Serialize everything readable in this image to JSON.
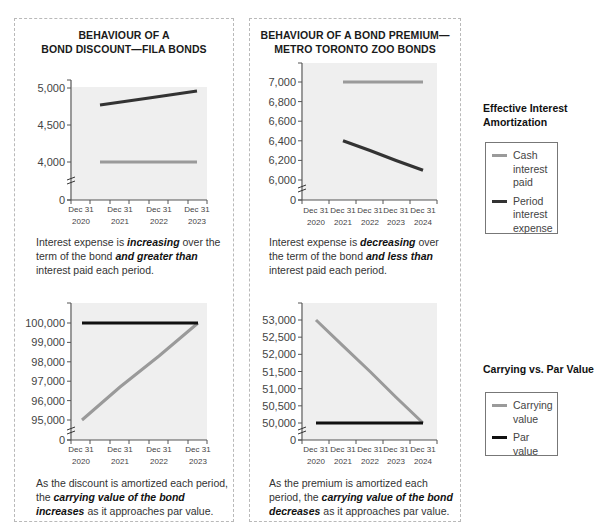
{
  "colors": {
    "cash_interest": "#9a9a9a",
    "interest_expense": "#333333",
    "carrying_value": "#9a9a9a",
    "par_value": "#111111",
    "plot_bg": "#efefef",
    "axis": "#555555"
  },
  "panels": [
    {
      "title_line1": "BEHAVIOUR OF A",
      "title_line2": "BOND DISCOUNT—FILA BONDS",
      "caption_top": {
        "p1": "Interest expense is ",
        "b1": "increasing",
        "p2": " over the term of the bond ",
        "b2": "and greater than",
        "p3": " interest paid each period."
      },
      "caption_bottom": {
        "p1": "As the discount is amortized each period, the ",
        "b1": "carrying value of the bond increases",
        "p2": " as it approaches par value."
      }
    },
    {
      "title_line1": "BEHAVIOUR OF A BOND PREMIUM—",
      "title_line2": "METRO TORONTO ZOO BONDS",
      "caption_top": {
        "p1": "Interest expense is ",
        "b1": "decreasing",
        "p2": " over the term of the bond ",
        "b2": "and less than",
        "p3": " interest paid each period."
      },
      "caption_bottom": {
        "p1": "As the premium is amortized each period, the ",
        "b1": "carrying value of the bond decreases",
        "p2": " as it approaches par value."
      }
    }
  ],
  "legends": [
    {
      "title_line1": "Effective Interest",
      "title_line2": "Amortization",
      "items": [
        {
          "label_lines": [
            "Cash",
            "interest",
            "paid"
          ],
          "color": "#9a9a9a"
        },
        {
          "label_lines": [
            "Period",
            "interest",
            "expense"
          ],
          "color": "#333333"
        }
      ]
    },
    {
      "title_line1": "Carrying vs. Par Value",
      "title_line2": "",
      "items": [
        {
          "label_lines": [
            "Carrying",
            "value"
          ],
          "color": "#9a9a9a"
        },
        {
          "label_lines": [
            "Par",
            "value"
          ],
          "color": "#111111"
        }
      ]
    }
  ],
  "chart_data": [
    {
      "type": "line",
      "title": "BEHAVIOUR OF A BOND DISCOUNT—FILA BONDS",
      "categories": [
        "Dec 31 2020",
        "Dec 31 2021",
        "Dec 31 2022",
        "Dec 31 2023"
      ],
      "series": [
        {
          "name": "Cash interest paid",
          "values": [
            null,
            4000,
            4000,
            4000
          ]
        },
        {
          "name": "Period interest expense",
          "values": [
            null,
            4770,
            4865,
            4960
          ]
        }
      ],
      "yticks": [
        "0",
        "4,000",
        "4,500",
        "5,000"
      ],
      "ylim": [
        0,
        5000
      ],
      "axis_break": true,
      "xlabel": "",
      "ylabel": "",
      "grid": false,
      "legend_position": "right"
    },
    {
      "type": "line",
      "title": "BEHAVIOUR OF A BOND PREMIUM—METRO TORONTO ZOO BONDS",
      "categories": [
        "Dec 31 2020",
        "Dec 31 2021",
        "Dec 31 2022",
        "Dec 31 2023",
        "Dec 31 2024"
      ],
      "series": [
        {
          "name": "Cash interest paid",
          "values": [
            null,
            7000,
            7000,
            7000,
            7000
          ]
        },
        {
          "name": "Period interest expense",
          "values": [
            null,
            6400,
            6300,
            6200,
            6100
          ]
        }
      ],
      "yticks": [
        "0",
        "6,000",
        "6,200",
        "6,400",
        "6,600",
        "6,800",
        "7,000"
      ],
      "ylim": [
        0,
        7150
      ],
      "axis_break": true,
      "xlabel": "",
      "ylabel": "",
      "grid": false,
      "legend_position": "right"
    },
    {
      "type": "line",
      "title": "Carrying vs. Par Value (Discount)",
      "categories": [
        "Dec 31 2020",
        "Dec 31 2021",
        "Dec 31 2022",
        "Dec 31 2023"
      ],
      "series": [
        {
          "name": "Carrying value",
          "values": [
            95000,
            96700,
            98300,
            100000
          ]
        },
        {
          "name": "Par value",
          "values": [
            100000,
            100000,
            100000,
            100000
          ]
        }
      ],
      "yticks": [
        "0",
        "95,000",
        "96,000",
        "97,000",
        "98,000",
        "99,000",
        "100,000"
      ],
      "ylim": [
        0,
        101000
      ],
      "axis_break": true,
      "xlabel": "",
      "ylabel": "",
      "grid": false,
      "legend_position": "right"
    },
    {
      "type": "line",
      "title": "Carrying vs. Par Value (Premium)",
      "categories": [
        "Dec 31 2020",
        "Dec 31 2021",
        "Dec 31 2022",
        "Dec 31 2023",
        "Dec 31 2024"
      ],
      "series": [
        {
          "name": "Carrying value",
          "values": [
            53000,
            52250,
            51500,
            50750,
            50000
          ]
        },
        {
          "name": "Par value",
          "values": [
            50000,
            50000,
            50000,
            50000,
            50000
          ]
        }
      ],
      "yticks": [
        "0",
        "50,000",
        "50,500",
        "51,000",
        "51,500",
        "52,000",
        "52,500",
        "53,000"
      ],
      "ylim": [
        0,
        53500
      ],
      "axis_break": true,
      "xlabel": "",
      "ylabel": "",
      "grid": false,
      "legend_position": "right"
    }
  ]
}
